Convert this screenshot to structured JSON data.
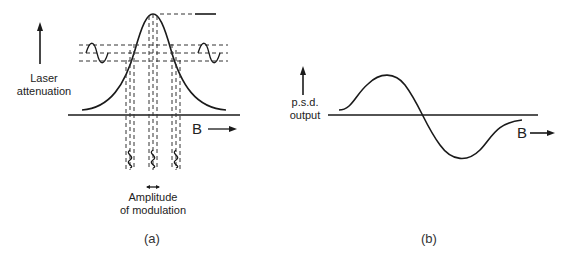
{
  "panel_a": {
    "y_label_line1": "Laser",
    "y_label_line2": "attenuation",
    "x_label": "B",
    "amplitude_label_line1": "Amplitude",
    "amplitude_label_line2": "of modulation",
    "caption": "(a)"
  },
  "panel_b": {
    "y_label_line1": "p.s.d.",
    "y_label_line2": "output",
    "x_label": "B",
    "caption": "(b)"
  }
}
